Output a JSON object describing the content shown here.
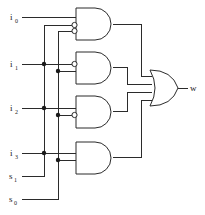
{
  "diagram": {
    "type": "logic-circuit",
    "stroke_color": "#2b2b2b",
    "fill_color": "#ffffff",
    "background_color": "#ffffff",
    "line_width": 1
  },
  "inputs": [
    {
      "id": "i0",
      "base": "i",
      "subscript": "0",
      "label": "i0",
      "y": 17
    },
    {
      "id": "i1",
      "base": "i",
      "subscript": "1",
      "label": "i1",
      "y": 64
    },
    {
      "id": "i2",
      "base": "i",
      "subscript": "2",
      "label": "i2",
      "y": 108
    },
    {
      "id": "i3",
      "base": "i",
      "subscript": "3",
      "label": "i3",
      "y": 153
    },
    {
      "id": "s1",
      "base": "s",
      "subscript": "1",
      "label": "s1",
      "y": 176
    },
    {
      "id": "s0",
      "base": "s",
      "subscript": "0",
      "label": "s0",
      "y": 199
    }
  ],
  "output": {
    "id": "w",
    "label": "w",
    "x": 190,
    "y": 88
  },
  "gates": [
    {
      "id": "and-gate-0",
      "type": "AND",
      "product_term": "i0 · s1' · s0'",
      "inverted_inputs": [
        "s1",
        "s0"
      ],
      "inputs": [
        "i0",
        "s1",
        "s0"
      ]
    },
    {
      "id": "and-gate-1",
      "type": "AND",
      "product_term": "i1 · s1' · s0",
      "inverted_inputs": [
        "s1"
      ],
      "inputs": [
        "i1",
        "s1",
        "s0"
      ]
    },
    {
      "id": "and-gate-2",
      "type": "AND",
      "product_term": "i2 · s1 · s0'",
      "inverted_inputs": [
        "s0"
      ],
      "inputs": [
        "i2",
        "s1",
        "s0"
      ]
    },
    {
      "id": "and-gate-3",
      "type": "AND",
      "product_term": "i3 · s1 · s0",
      "inverted_inputs": [],
      "inputs": [
        "i3",
        "s1",
        "s0"
      ]
    },
    {
      "id": "or-gate",
      "type": "OR",
      "product_term": "w",
      "inverted_inputs": [],
      "inputs": [
        "and-gate-0",
        "and-gate-1",
        "and-gate-2",
        "and-gate-3"
      ]
    }
  ],
  "junctions": [
    {
      "id": "junction-s1-i1",
      "x": 44,
      "y": 64
    },
    {
      "id": "junction-s0-i1",
      "x": 58,
      "y": 71
    },
    {
      "id": "junction-s1-i2",
      "x": 44,
      "y": 108
    },
    {
      "id": "junction-s0-i2",
      "x": 58,
      "y": 115
    },
    {
      "id": "junction-s1-i3",
      "x": 44,
      "y": 153
    },
    {
      "id": "junction-s0-i3",
      "x": 58,
      "y": 160
    }
  ],
  "buses": [
    {
      "id": "bus-s1",
      "x": 44,
      "from_y": 25,
      "to_y": 176
    },
    {
      "id": "bus-s0",
      "x": 58,
      "from_y": 31,
      "to_y": 199
    }
  ]
}
